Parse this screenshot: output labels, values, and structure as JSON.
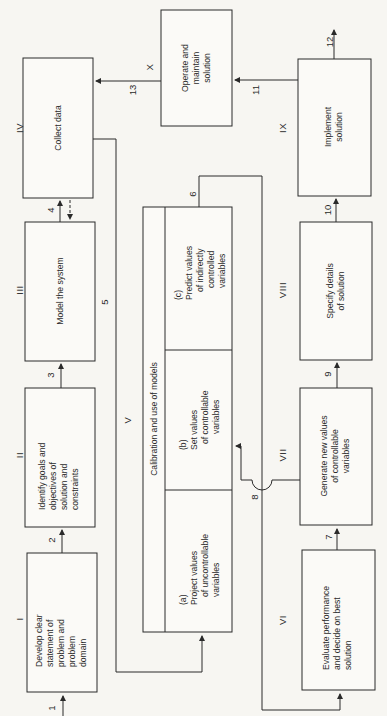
{
  "diagram": {
    "orientation": "rotated 90° counter-clockwise",
    "stages": [
      {
        "id": "I",
        "label": [
          "Develop clear",
          "statement of",
          "problem and",
          "problem",
          "domain"
        ]
      },
      {
        "id": "II",
        "label": [
          "Identify goals and",
          "objectives of",
          "solution and",
          "constraints"
        ]
      },
      {
        "id": "III",
        "label": [
          "Model the system"
        ]
      },
      {
        "id": "IV",
        "label": [
          "Collect data"
        ]
      },
      {
        "id": "V",
        "label": [
          "Calibration and use of models"
        ]
      },
      {
        "id": "VI",
        "label": [
          "Evaluate performance",
          "and decide on best",
          "solution"
        ]
      },
      {
        "id": "VII",
        "label": [
          "Generate new values",
          "of controllable",
          "variables"
        ]
      },
      {
        "id": "VIII",
        "label": [
          "Specify details",
          "of solution"
        ]
      },
      {
        "id": "IX",
        "label": [
          "Implement",
          "solution"
        ]
      },
      {
        "id": "X",
        "label": [
          "Operate and",
          "maintain",
          "solution"
        ]
      }
    ],
    "substeps": [
      {
        "id": "a",
        "tag": "(a)",
        "label": [
          "Project values",
          "of uncontrollable",
          "variables"
        ]
      },
      {
        "id": "b",
        "tag": "(b)",
        "label": [
          "Set values",
          "of controllable",
          "variables"
        ]
      },
      {
        "id": "c",
        "tag": "(c)",
        "label": [
          "Predict values",
          "of indirectly",
          "controlled",
          "variables"
        ]
      }
    ],
    "flows": [
      "1",
      "2",
      "3",
      "4",
      "5",
      "6",
      "7",
      "8",
      "9",
      "10",
      "11",
      "12",
      "13"
    ]
  }
}
